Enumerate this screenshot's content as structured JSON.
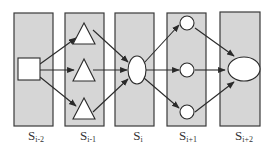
{
  "diagram": {
    "type": "layered-flow",
    "stages": [
      {
        "id": "s_im2",
        "base": "S",
        "sub": "i-2",
        "x": 14,
        "cx": 33
      },
      {
        "id": "s_im1",
        "base": "S",
        "sub": "i-1",
        "x": 65,
        "cx": 84
      },
      {
        "id": "s_i",
        "base": "S",
        "sub": "i",
        "x": 115,
        "cx": 137
      },
      {
        "id": "s_ip1",
        "base": "S",
        "sub": "i+1",
        "x": 167,
        "cx": 187
      },
      {
        "id": "s_ip2",
        "base": "S",
        "sub": "i+2",
        "x": 220,
        "cx": 244
      }
    ],
    "nodes": [
      {
        "id": "n_square",
        "stage": "s_im2",
        "shape": "square"
      },
      {
        "id": "n_tri_top",
        "stage": "s_im1",
        "shape": "triangle"
      },
      {
        "id": "n_tri_mid",
        "stage": "s_im1",
        "shape": "triangle"
      },
      {
        "id": "n_tri_bot",
        "stage": "s_im1",
        "shape": "triangle"
      },
      {
        "id": "n_ellipse_i",
        "stage": "s_i",
        "shape": "ellipse"
      },
      {
        "id": "n_circ_top",
        "stage": "s_ip1",
        "shape": "circle"
      },
      {
        "id": "n_circ_mid",
        "stage": "s_ip1",
        "shape": "circle"
      },
      {
        "id": "n_circ_bot",
        "stage": "s_ip1",
        "shape": "circle"
      },
      {
        "id": "n_ellipse_ip2",
        "stage": "s_ip2",
        "shape": "ellipse"
      }
    ],
    "edges": [
      [
        "n_square",
        "n_tri_top"
      ],
      [
        "n_square",
        "n_tri_mid"
      ],
      [
        "n_square",
        "n_tri_bot"
      ],
      [
        "n_tri_top",
        "n_ellipse_i"
      ],
      [
        "n_tri_mid",
        "n_ellipse_i"
      ],
      [
        "n_tri_bot",
        "n_ellipse_i"
      ],
      [
        "n_ellipse_i",
        "n_circ_top"
      ],
      [
        "n_ellipse_i",
        "n_circ_mid"
      ],
      [
        "n_ellipse_i",
        "n_circ_bot"
      ],
      [
        "n_circ_top",
        "n_ellipse_ip2"
      ],
      [
        "n_circ_mid",
        "n_ellipse_ip2"
      ],
      [
        "n_circ_bot",
        "n_ellipse_ip2"
      ]
    ],
    "colors": {
      "stage_fill": "#d6d6d6",
      "stage_stroke": "#3a3a3a",
      "node_fill": "#ffffff",
      "edge": "#2a2a2a"
    }
  },
  "labels": {
    "s_im2": {
      "base": "S",
      "sub": "i-2"
    },
    "s_im1": {
      "base": "S",
      "sub": "i-1"
    },
    "s_i": {
      "base": "S",
      "sub": "i"
    },
    "s_ip1": {
      "base": "S",
      "sub": "i+1"
    },
    "s_ip2": {
      "base": "S",
      "sub": "i+2"
    }
  }
}
